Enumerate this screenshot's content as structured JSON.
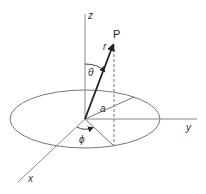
{
  "diagram": {
    "labels": {
      "z_axis": "z",
      "y_axis": "y",
      "x_axis": "x",
      "point": "P",
      "radius_vector": "r",
      "polar_angle": "θ",
      "azimuth_angle": "ϕ",
      "loop_radius": "a"
    },
    "colors": {
      "line": "#777777",
      "vector": "#222222",
      "text": "#333333"
    }
  }
}
